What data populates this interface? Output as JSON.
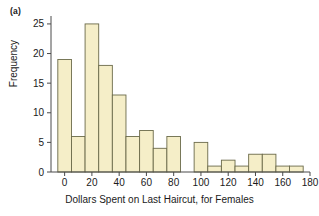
{
  "panel": {
    "label": "(a)"
  },
  "chart_data": {
    "type": "bar",
    "title": "",
    "xlabel": "Dollars Spent on Last Haircut, for Females",
    "ylabel": "Frequency",
    "bin_width": 10,
    "bin_centers": [
      0,
      10,
      20,
      30,
      40,
      50,
      60,
      70,
      80,
      90,
      100,
      110,
      120,
      130,
      140,
      150,
      160,
      170
    ],
    "bin_edges": [
      -5,
      5,
      15,
      25,
      35,
      45,
      55,
      65,
      75,
      85,
      95,
      105,
      115,
      125,
      135,
      145,
      155,
      165,
      175
    ],
    "categories": [
      "0",
      "10",
      "20",
      "30",
      "40",
      "50",
      "60",
      "70",
      "80",
      "90",
      "100",
      "110",
      "120",
      "130",
      "140",
      "150",
      "160",
      "170"
    ],
    "values": [
      19,
      6,
      25,
      18,
      13,
      6,
      7,
      4,
      6,
      0,
      5,
      1,
      2,
      1,
      3,
      3,
      1,
      1
    ],
    "xlim": [
      -10,
      180
    ],
    "ylim": [
      0,
      26
    ],
    "xticks": [
      0,
      20,
      40,
      60,
      80,
      100,
      120,
      140,
      160,
      180
    ],
    "xtick_labels": [
      "0",
      "20",
      "40",
      "60",
      "80",
      "100",
      "120",
      "140",
      "160",
      "180"
    ],
    "yticks": [
      0,
      5,
      10,
      15,
      20,
      25
    ],
    "ytick_labels": [
      "0",
      "5",
      "10",
      "15",
      "20",
      "25"
    ],
    "grid": false,
    "legend": "none",
    "bar_fill_color": "#f5eec8",
    "bar_edge_color": "#6b6a4a",
    "axis_color": "#4a4a4a"
  }
}
